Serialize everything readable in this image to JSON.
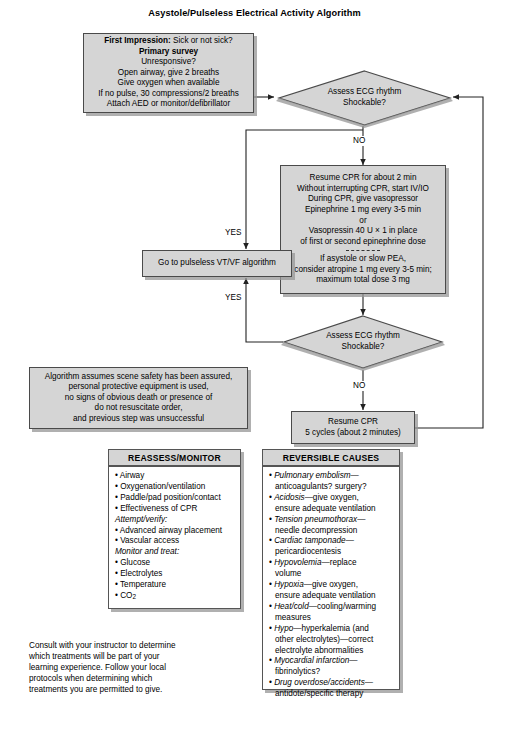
{
  "title": "Asystole/Pulseless Electrical Activity Algorithm",
  "colors": {
    "box_fill": "#d5d5d5",
    "box_border": "#4a4a4a",
    "panel_fill": "#ffffff",
    "shadow": "#969696",
    "text": "#000000"
  },
  "first_impression_box": {
    "name": "first-impression-box",
    "lines": [
      {
        "bold_prefix": "First Impression:",
        "text": " Sick or not sick?"
      },
      {
        "bold_prefix": "Primary survey",
        "text": ""
      },
      {
        "bold_prefix": "",
        "text": "Unresponsive?"
      },
      {
        "bold_prefix": "",
        "text": "Open airway, give 2 breaths"
      },
      {
        "bold_prefix": "",
        "text": "Give oxygen when available"
      },
      {
        "bold_prefix": "",
        "text": "If no pulse, 30 compressions/2 breaths"
      },
      {
        "bold_prefix": "",
        "text": "Attach AED or monitor/defibrillator"
      }
    ]
  },
  "decision_1": {
    "name": "assess-ecg-rhythm-decision-1",
    "lines": [
      "Assess ECG rhythm",
      "Shockable?"
    ]
  },
  "decision_2": {
    "name": "assess-ecg-rhythm-decision-2",
    "lines": [
      "Assess ECG rhythm",
      "Shockable?"
    ]
  },
  "resume_cpr_box": {
    "name": "resume-cpr-protocol-box",
    "lines_top": [
      "Resume CPR for about 2 min",
      "Without interrupting CPR, start IV/IO",
      "During CPR, give vasopressor",
      "Epinephrine 1 mg every 3-5 min",
      "or",
      "Vasopressin 40 U × 1 in place",
      "of first or second epinephrine dose"
    ],
    "lines_bottom": [
      "If asystole or slow PEA,",
      "consider atropine 1 mg every 3-5 min;",
      "maximum total dose 3 mg"
    ]
  },
  "vtvf_box": {
    "name": "go-to-pulseless-vtvf-box",
    "text": "Go to pulseless VT/VF algorithm"
  },
  "resume_cpr_cycles_box": {
    "name": "resume-cpr-cycles-box",
    "lines": [
      "Resume CPR",
      "5 cycles (about 2 minutes)"
    ]
  },
  "assumptions_box": {
    "name": "algorithm-assumptions-box",
    "lines": [
      "Algorithm assumes scene safety has been assured,",
      "personal protective equipment is used,",
      "no signs of obvious death or presence of",
      "do not resuscitate order,",
      "and previous step was unsuccessful"
    ]
  },
  "edge_labels": {
    "no_1": "NO",
    "no_2": "NO",
    "yes_1": "YES",
    "yes_2": "YES"
  },
  "reassess_panel": {
    "name": "reassess-monitor-panel",
    "header": "REASSESS/MONITOR",
    "items": [
      {
        "type": "bullet",
        "text": "Airway"
      },
      {
        "type": "bullet",
        "text": "Oxygenation/ventilation"
      },
      {
        "type": "bullet",
        "text": "Paddle/pad position/contact"
      },
      {
        "type": "bullet",
        "text": "Effectiveness of CPR"
      },
      {
        "type": "subhead",
        "text": "Attempt/verify:"
      },
      {
        "type": "bullet",
        "text": "Advanced airway placement"
      },
      {
        "type": "bullet",
        "text": "Vascular access"
      },
      {
        "type": "subhead",
        "text": "Monitor and treat:"
      },
      {
        "type": "bullet",
        "text": "Glucose"
      },
      {
        "type": "bullet",
        "text": "Electrolytes"
      },
      {
        "type": "bullet",
        "text": "Temperature"
      },
      {
        "type": "bullet",
        "text": "CO2",
        "subscript": true
      }
    ]
  },
  "reversible_panel": {
    "name": "reversible-causes-panel",
    "header": "REVERSIBLE CAUSES",
    "items": [
      {
        "italic": "Pulmonary embolism",
        "rest": "—",
        "cont": [
          "anticoagulants? surgery?"
        ]
      },
      {
        "italic": "Acidosis",
        "rest": "—give oxygen,",
        "cont": [
          "ensure adequate ventilation"
        ]
      },
      {
        "italic": "Tension pneumothorax",
        "rest": "—",
        "cont": [
          "needle decompression"
        ]
      },
      {
        "italic": "Cardiac tamponade",
        "rest": "—",
        "cont": [
          "pericardiocentesis"
        ]
      },
      {
        "italic": "Hypovolemia",
        "rest": "—replace",
        "cont": [
          "volume"
        ]
      },
      {
        "italic": "Hypoxia",
        "rest": "—give oxygen,",
        "cont": [
          "ensure adequate ventilation"
        ]
      },
      {
        "italic": "Heat/cold",
        "rest": "—cooling/warming",
        "cont": [
          "measures"
        ]
      },
      {
        "italic": "Hypo",
        "rest": "—hyperkalemia (and",
        "cont": [
          "other electrolytes)—correct",
          "electrolyte abnormalities"
        ]
      },
      {
        "italic": "Myocardial infarction",
        "rest": "—",
        "cont": [
          "fibrinolytics?"
        ]
      },
      {
        "italic": "Drug overdose/accidents",
        "rest": "—",
        "cont": [
          "antidote/specific therapy"
        ]
      }
    ]
  },
  "footnote": {
    "name": "instructor-consult-note",
    "text": "Consult with your instructor to determine which treatments will be part of your learning experience. Follow your local protocols when determining which treatments you are permitted to give."
  }
}
